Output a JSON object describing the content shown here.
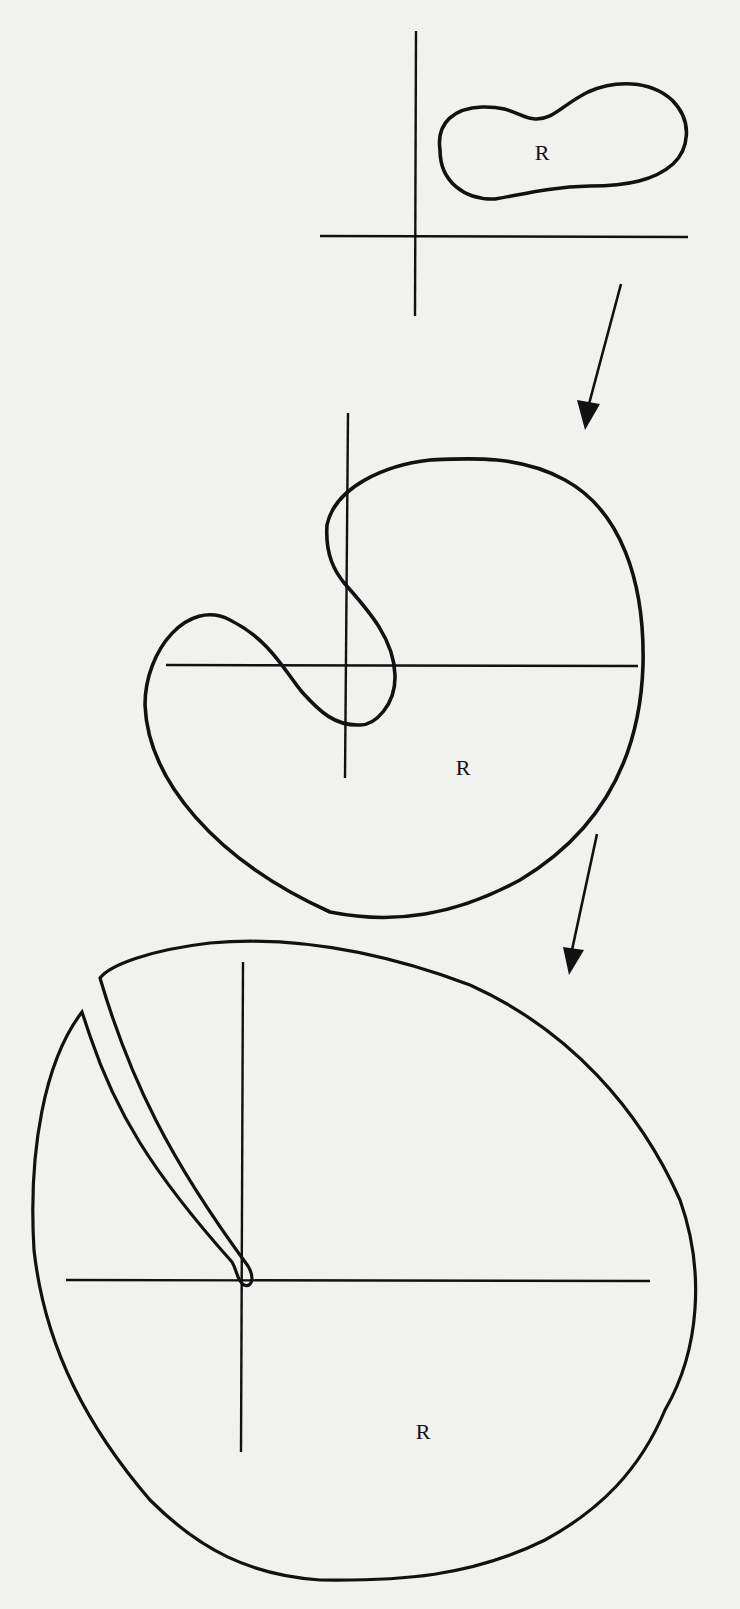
{
  "figure": {
    "colors": {
      "paper": "#f1f1ef",
      "ink": "#111111"
    },
    "stages": [
      {
        "id": "stage-1",
        "region_label": "R",
        "shape": "peanut-shaped simple closed curve lying in first quadrant, not enclosing origin"
      },
      {
        "id": "stage-2",
        "region_label": "R",
        "shape": "curve wrapping around origin with S-shaped inward fold crossing both axes"
      },
      {
        "id": "stage-3",
        "region_label": "R",
        "shape": "large region surrounding origin with a thin slit cut reaching the origin from upper-left"
      }
    ],
    "arrows": [
      {
        "from": "stage-1",
        "to": "stage-2",
        "icon": "arrow-down-left"
      },
      {
        "from": "stage-2",
        "to": "stage-3",
        "icon": "arrow-down-left"
      }
    ]
  }
}
